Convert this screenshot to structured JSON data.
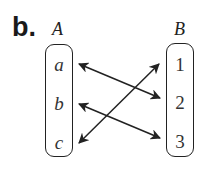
{
  "part_label": "b.",
  "sets": {
    "A": {
      "title": "A",
      "elements": [
        "a",
        "b",
        "c"
      ]
    },
    "B": {
      "title": "B",
      "elements": [
        "1",
        "2",
        "3"
      ]
    }
  },
  "mappings": [
    {
      "from": "a",
      "to": "2",
      "type": "double-arrow"
    },
    {
      "from": "b",
      "to": "3",
      "type": "double-arrow"
    },
    {
      "from": "c",
      "to": "1",
      "type": "double-arrow"
    }
  ],
  "colors": {
    "stroke": "#222222",
    "text": "#333333",
    "background": "#ffffff"
  }
}
